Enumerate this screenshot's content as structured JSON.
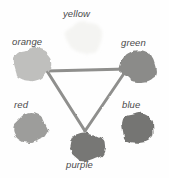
{
  "figure": {
    "background_color": "#fefefe",
    "width": 169,
    "height": 178
  },
  "chart_data": {
    "type": "diagram",
    "title": "",
    "nodes": [
      {
        "id": "yellow",
        "label": "yellow",
        "cx": 85,
        "cy": 37,
        "rx": 19,
        "ry": 17,
        "fill": "#f4f4f2",
        "label_x": 63,
        "label_y": 8,
        "label_align": "center",
        "in_triangle": false
      },
      {
        "id": "orange",
        "label": "orange",
        "cx": 32,
        "cy": 65,
        "rx": 19,
        "ry": 17,
        "fill": "#bfbfbd",
        "label_x": 12,
        "label_y": 36,
        "label_align": "left",
        "in_triangle": true
      },
      {
        "id": "green",
        "label": "green",
        "cx": 139,
        "cy": 66,
        "rx": 18,
        "ry": 17,
        "fill": "#8b8b89",
        "label_x": 121,
        "label_y": 37,
        "label_align": "left",
        "in_triangle": true
      },
      {
        "id": "red",
        "label": "red",
        "cx": 30,
        "cy": 129,
        "rx": 17,
        "ry": 15,
        "fill": "#9d9d9b",
        "label_x": 14,
        "label_y": 99,
        "label_align": "left",
        "in_triangle": false
      },
      {
        "id": "blue",
        "label": "blue",
        "cx": 138,
        "cy": 128,
        "rx": 17,
        "ry": 16,
        "fill": "#757573",
        "label_x": 122,
        "label_y": 99,
        "label_align": "left",
        "in_triangle": false
      },
      {
        "id": "purple",
        "label": "purple",
        "cx": 87,
        "cy": 147,
        "rx": 18,
        "ry": 16,
        "fill": "#777775",
        "label_x": 66,
        "label_y": 159,
        "label_align": "center",
        "in_triangle": true
      }
    ],
    "edges": [
      {
        "from": "orange",
        "to": "green",
        "stroke": "#8f8f8d"
      },
      {
        "from": "green",
        "to": "purple",
        "stroke": "#8f8f8d"
      },
      {
        "from": "purple",
        "to": "orange",
        "stroke": "#8f8f8d"
      }
    ],
    "triangle_vertices": [
      {
        "node": "orange",
        "x": 47,
        "y": 71
      },
      {
        "node": "green",
        "x": 127,
        "y": 69
      },
      {
        "node": "purple",
        "x": 85,
        "y": 131
      }
    ],
    "edge_stroke_width": 3,
    "legend": [],
    "annotations": []
  }
}
